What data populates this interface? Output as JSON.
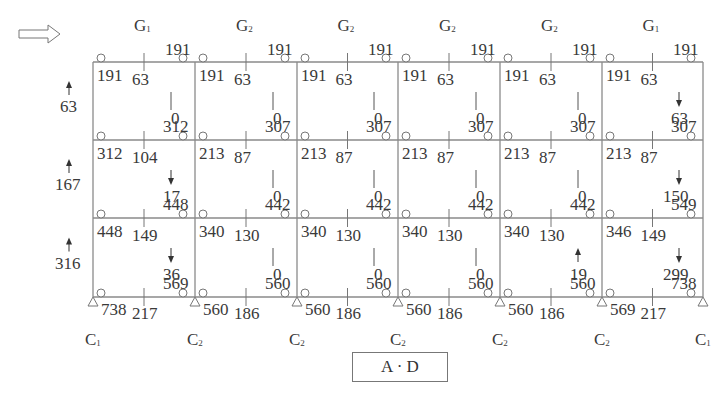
{
  "title": "A · D",
  "load_direction_arrow": "hollow-right-arrow",
  "grid": {
    "columns_x": [
      93,
      195,
      297,
      398,
      500,
      602,
      703
    ],
    "beams_y": [
      62,
      140,
      218,
      297
    ]
  },
  "beam_labels": [
    "G1",
    "G2",
    "G2",
    "G2",
    "G2",
    "G1"
  ],
  "column_labels": [
    "C1",
    "C2",
    "C2",
    "C2",
    "C2",
    "C2",
    "C1"
  ],
  "story_shears": [
    {
      "value": "63",
      "arrow": "up"
    },
    {
      "value": "167",
      "arrow": "up"
    },
    {
      "value": "316",
      "arrow": "up"
    }
  ],
  "top_right_moments": [
    "191",
    "191",
    "191",
    "191",
    "191",
    "191"
  ],
  "bays": [
    [
      {
        "left": "191",
        "mid": "63",
        "axial": "0",
        "axial_arrow": "none",
        "right": "312"
      },
      {
        "left": "191",
        "mid": "63",
        "axial": "0",
        "axial_arrow": "none",
        "right": "307"
      },
      {
        "left": "191",
        "mid": "63",
        "axial": "0",
        "axial_arrow": "none",
        "right": "307"
      },
      {
        "left": "191",
        "mid": "63",
        "axial": "0",
        "axial_arrow": "none",
        "right": "307"
      },
      {
        "left": "191",
        "mid": "63",
        "axial": "0",
        "axial_arrow": "none",
        "right": "307"
      },
      {
        "left": "191",
        "mid": "63",
        "axial": "63",
        "axial_arrow": "down",
        "right": "307"
      }
    ],
    [
      {
        "left": "312",
        "mid": "104",
        "axial": "17",
        "axial_arrow": "down",
        "right": "448"
      },
      {
        "left": "213",
        "mid": "87",
        "axial": "0",
        "axial_arrow": "none",
        "right": "442"
      },
      {
        "left": "213",
        "mid": "87",
        "axial": "0",
        "axial_arrow": "none",
        "right": "442"
      },
      {
        "left": "213",
        "mid": "87",
        "axial": "0",
        "axial_arrow": "none",
        "right": "442"
      },
      {
        "left": "213",
        "mid": "87",
        "axial": "0",
        "axial_arrow": "none",
        "right": "442"
      },
      {
        "left": "213",
        "mid": "87",
        "axial": "150",
        "axial_arrow": "down",
        "right": "549"
      }
    ],
    [
      {
        "left": "448",
        "mid": "149",
        "axial": "36",
        "axial_arrow": "down",
        "right": "569"
      },
      {
        "left": "340",
        "mid": "130",
        "axial": "0",
        "axial_arrow": "none",
        "right": "560"
      },
      {
        "left": "340",
        "mid": "130",
        "axial": "0",
        "axial_arrow": "none",
        "right": "560"
      },
      {
        "left": "340",
        "mid": "130",
        "axial": "0",
        "axial_arrow": "none",
        "right": "560"
      },
      {
        "left": "340",
        "mid": "130",
        "axial": "19",
        "axial_arrow": "up",
        "right": "560"
      },
      {
        "left": "346",
        "mid": "149",
        "axial": "299",
        "axial_arrow": "down",
        "right": "738"
      }
    ]
  ],
  "base": [
    {
      "left": "738",
      "mid": "217"
    },
    {
      "left": "560",
      "mid": "186"
    },
    {
      "left": "560",
      "mid": "186"
    },
    {
      "left": "560",
      "mid": "186"
    },
    {
      "left": "560",
      "mid": "186"
    },
    {
      "left": "569",
      "mid": "217"
    }
  ],
  "colors": {
    "line": "#8a8a8a",
    "text": "#3a3a3a"
  }
}
